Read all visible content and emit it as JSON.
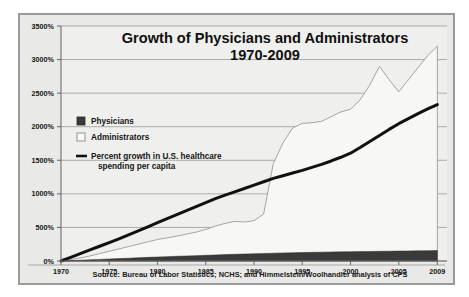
{
  "figure": {
    "source_note": "Source: Bureau of Labor Statistics; NCHS; and Himmelstein/Woolhandler analysis of CPS"
  },
  "legend": {
    "physicians_label": "Physicians",
    "administrators_label": "Administrators",
    "spending_label_line1": "Percent growth in U.S. healthcare",
    "spending_label_line2": "spending per capita"
  },
  "colors": {
    "physicians_swatch": "#3a3a3a",
    "administrators_swatch": "#f9f9f7",
    "spending_line": "#111111",
    "plot_background": "#efefed",
    "frame_border": "#9a9a98"
  },
  "chart_data": {
    "type": "area",
    "title": "Growth of Physicians and Administrators",
    "subtitle": "1970-2009",
    "title_line1": "Growth of Physicians and Administrators",
    "title_line2": "1970-2009",
    "xlabel": "",
    "ylabel": "",
    "xlim": [
      1970,
      2010
    ],
    "ylim": [
      0,
      3500
    ],
    "grid": true,
    "legend_position": "inside-left",
    "ytick_labels": [
      "0%",
      "500%",
      "1000%",
      "1500%",
      "2000%",
      "2500%",
      "3000%",
      "3500%"
    ],
    "ytick_values": [
      0,
      500,
      1000,
      1500,
      2000,
      2500,
      3000,
      3500
    ],
    "xtick_labels": [
      "1970",
      "1975",
      "1980",
      "1985",
      "1990",
      "1995",
      "2000",
      "2005",
      "2009"
    ],
    "xtick_values": [
      1970,
      1975,
      1980,
      1985,
      1990,
      1995,
      2000,
      2005,
      2009
    ],
    "x": [
      1970,
      1971,
      1972,
      1973,
      1974,
      1975,
      1976,
      1977,
      1978,
      1979,
      1980,
      1981,
      1982,
      1983,
      1984,
      1985,
      1986,
      1987,
      1988,
      1989,
      1990,
      1991,
      1992,
      1993,
      1994,
      1995,
      1996,
      1997,
      1998,
      1999,
      2000,
      2001,
      2002,
      2003,
      2004,
      2005,
      2006,
      2007,
      2008,
      2009
    ],
    "series": [
      {
        "name": "Administrators",
        "kind": "area",
        "color": "#f7f7f5",
        "values": [
          0,
          20,
          45,
          75,
          110,
          145,
          180,
          215,
          250,
          285,
          320,
          345,
          370,
          400,
          430,
          470,
          520,
          560,
          590,
          580,
          600,
          700,
          1450,
          1760,
          1980,
          2050,
          2060,
          2080,
          2150,
          2220,
          2260,
          2400,
          2620,
          2900,
          2700,
          2520,
          2700,
          2880,
          3060,
          3200
        ]
      },
      {
        "name": "Physicians",
        "kind": "area",
        "color": "#3a3a3a",
        "values": [
          0,
          6,
          12,
          18,
          24,
          30,
          36,
          42,
          48,
          54,
          60,
          65,
          70,
          75,
          80,
          85,
          90,
          95,
          100,
          104,
          108,
          112,
          116,
          120,
          123,
          126,
          129,
          132,
          134,
          136,
          138,
          140,
          142,
          144,
          146,
          148,
          150,
          152,
          154,
          156
        ]
      },
      {
        "name": "Percent growth in U.S. healthcare spending per capita",
        "kind": "line",
        "color": "#111111",
        "values": [
          0,
          55,
          110,
          165,
          220,
          275,
          330,
          390,
          450,
          510,
          570,
          630,
          690,
          750,
          810,
          870,
          930,
          980,
          1030,
          1080,
          1130,
          1180,
          1230,
          1270,
          1310,
          1350,
          1395,
          1440,
          1490,
          1545,
          1605,
          1690,
          1780,
          1870,
          1960,
          2045,
          2120,
          2195,
          2265,
          2330
        ]
      }
    ]
  }
}
